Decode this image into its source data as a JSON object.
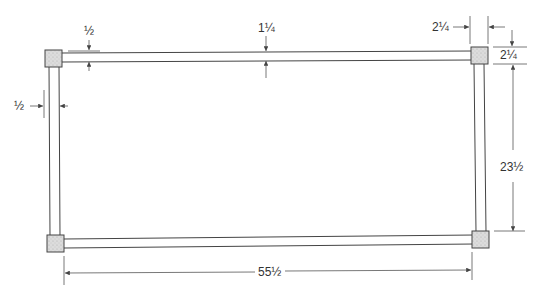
{
  "diagram": {
    "type": "frame-dimension-drawing",
    "dimensions": {
      "rail_thickness_top": "½",
      "rail_width_top": "1¼",
      "corner_block_width": "2¼",
      "corner_block_height": "2¼",
      "stile_thickness_left": "½",
      "inner_height": "23½",
      "overall_length": "55½"
    },
    "colors": {
      "line": "#444444",
      "block_fill": "#d8d8d8",
      "text": "#333333"
    }
  }
}
